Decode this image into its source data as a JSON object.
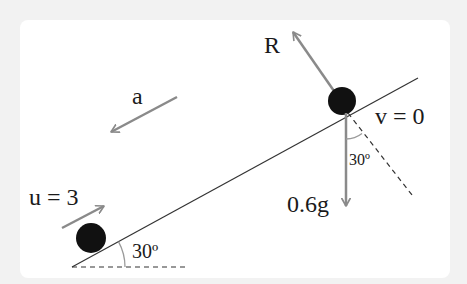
{
  "diagram": {
    "type": "inclined-plane-mechanics",
    "incline_angle_label": "30º",
    "normal_angle_label": "30º",
    "labels": {
      "reaction": "R",
      "acceleration": "a",
      "final_velocity": "v = 0",
      "initial_velocity": "u = 3",
      "weight": "0.6g"
    },
    "colors": {
      "background": "#f2f2f2",
      "card": "#ffffff",
      "plane_line": "#333333",
      "force_arrow": "#8a8a8a",
      "particle": "#111111",
      "text": "#1a1a1a"
    }
  }
}
